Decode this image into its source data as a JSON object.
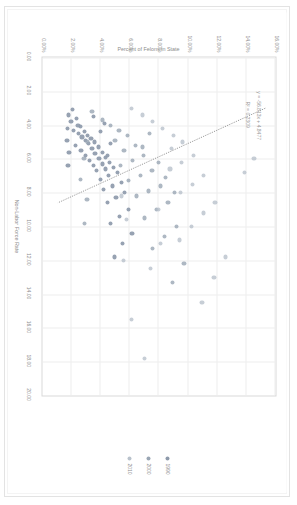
{
  "chart_data": {
    "type": "scatter",
    "title": "",
    "xlabel": "Non-Labor Force Rate",
    "ylabel": "Percent of Felons in State",
    "xlim": [
      0,
      20
    ],
    "ylim": [
      0,
      0.16
    ],
    "grid": true,
    "legend_position": "right",
    "x_ticks": [
      "0.00",
      "2.00",
      "4.00",
      "6.00",
      "8.00",
      "10.00",
      "12.00",
      "14.00",
      "16.00",
      "18.00",
      "20.00"
    ],
    "y_ticks": [
      "0.00%",
      "2.00%",
      "4.00%",
      "6.00%",
      "8.00%",
      "10.00%",
      "12.00%",
      "14.00%",
      "16.00%"
    ],
    "annotations": {
      "equation": "y = -56.813x + 4.8477",
      "r_squared": "R² = 0.2309"
    },
    "trendline": {
      "style": "dotted",
      "color": "#808080",
      "slope": -56.813,
      "intercept": 4.8477,
      "r2": 0.2309
    },
    "series": [
      {
        "name": "1990",
        "color": "#8e9aab",
        "points": [
          [
            3.1,
            0.0205
          ],
          [
            3.4,
            0.0178
          ],
          [
            3.6,
            0.0232
          ],
          [
            3.8,
            0.0196
          ],
          [
            4.0,
            0.0244
          ],
          [
            4.1,
            0.0262
          ],
          [
            4.3,
            0.0215
          ],
          [
            4.4,
            0.0288
          ],
          [
            4.5,
            0.025
          ],
          [
            4.6,
            0.031
          ],
          [
            4.7,
            0.0271
          ],
          [
            4.8,
            0.0333
          ],
          [
            4.9,
            0.0295
          ],
          [
            5.0,
            0.0358
          ],
          [
            5.1,
            0.0318
          ],
          [
            5.2,
            0.0225
          ],
          [
            5.3,
            0.0382
          ],
          [
            5.4,
            0.034
          ],
          [
            5.5,
            0.0264
          ],
          [
            5.6,
            0.041
          ],
          [
            5.7,
            0.0361
          ],
          [
            5.8,
            0.0298
          ],
          [
            5.9,
            0.0435
          ],
          [
            6.0,
            0.0388
          ],
          [
            6.1,
            0.0322
          ],
          [
            6.2,
            0.0462
          ],
          [
            6.3,
            0.041
          ],
          [
            6.4,
            0.0349
          ],
          [
            6.5,
            0.0488
          ],
          [
            6.6,
            0.0432
          ],
          [
            6.7,
            0.0372
          ],
          [
            6.8,
            0.0515
          ],
          [
            7.0,
            0.0455
          ],
          [
            7.2,
            0.0398
          ],
          [
            7.4,
            0.054
          ],
          [
            7.6,
            0.048
          ],
          [
            7.8,
            0.042
          ],
          [
            8.0,
            0.0565
          ],
          [
            8.3,
            0.0505
          ],
          [
            8.6,
            0.0445
          ],
          [
            9.0,
            0.059
          ],
          [
            9.4,
            0.0528
          ],
          [
            9.8,
            0.0468
          ],
          [
            10.4,
            0.0615
          ],
          [
            11.0,
            0.0552
          ],
          [
            11.8,
            0.0492
          ],
          [
            4.2,
            0.017
          ],
          [
            4.9,
            0.0168
          ],
          [
            5.6,
            0.0182
          ],
          [
            6.4,
            0.0175
          ],
          [
            3.5,
            0.035
          ],
          [
            3.9,
            0.0425
          ],
          [
            4.4,
            0.0398
          ],
          [
            5.1,
            0.0468
          ],
          [
            5.8,
            0.0448
          ]
        ]
      },
      {
        "name": "2000",
        "color": "#9aa6b4",
        "points": [
          [
            3.2,
            0.034
          ],
          [
            3.7,
            0.0412
          ],
          [
            4.0,
            0.0468
          ],
          [
            4.3,
            0.0525
          ],
          [
            4.6,
            0.0582
          ],
          [
            4.9,
            0.0498
          ],
          [
            5.2,
            0.064
          ],
          [
            5.5,
            0.056
          ],
          [
            5.8,
            0.0695
          ],
          [
            6.1,
            0.0618
          ],
          [
            6.4,
            0.0538
          ],
          [
            6.7,
            0.0752
          ],
          [
            7.0,
            0.0672
          ],
          [
            7.3,
            0.0592
          ],
          [
            7.6,
            0.0808
          ],
          [
            7.9,
            0.0728
          ],
          [
            8.2,
            0.0648
          ],
          [
            8.6,
            0.0862
          ],
          [
            9.0,
            0.0782
          ],
          [
            9.5,
            0.07
          ],
          [
            10.0,
            0.0918
          ],
          [
            10.6,
            0.0838
          ],
          [
            11.3,
            0.0755
          ],
          [
            12.2,
            0.0972
          ],
          [
            13.3,
            0.089
          ],
          [
            5.0,
            0.0308
          ],
          [
            6.0,
            0.0285
          ],
          [
            7.2,
            0.0262
          ],
          [
            8.4,
            0.0305
          ],
          [
            9.8,
            0.0288
          ],
          [
            4.5,
            0.0732
          ],
          [
            5.3,
            0.0688
          ],
          [
            6.2,
            0.0795
          ],
          [
            7.1,
            0.0845
          ],
          [
            8.0,
            0.0905
          ]
        ]
      },
      {
        "name": "2010",
        "color": "#b9c2cc",
        "points": [
          [
            3.0,
            0.0612
          ],
          [
            3.4,
            0.0688
          ],
          [
            3.8,
            0.0755
          ],
          [
            4.2,
            0.0822
          ],
          [
            4.6,
            0.0898
          ],
          [
            5.0,
            0.0962
          ],
          [
            5.4,
            0.0885
          ],
          [
            5.8,
            0.1035
          ],
          [
            6.2,
            0.0955
          ],
          [
            6.6,
            0.0875
          ],
          [
            7.0,
            0.1108
          ],
          [
            7.5,
            0.1028
          ],
          [
            8.0,
            0.0948
          ],
          [
            8.6,
            0.1185
          ],
          [
            9.2,
            0.1105
          ],
          [
            10.0,
            0.1022
          ],
          [
            10.8,
            0.0942
          ],
          [
            11.8,
            0.1258
          ],
          [
            13.0,
            0.1178
          ],
          [
            14.5,
            0.1095
          ],
          [
            6.0,
            0.1452
          ],
          [
            6.8,
            0.1385
          ],
          [
            9.0,
            0.0795
          ],
          [
            11.0,
            0.0812
          ],
          [
            12.5,
            0.0742
          ],
          [
            15.5,
            0.0612
          ],
          [
            17.8,
            0.0702
          ],
          [
            12.0,
            0.0558
          ],
          [
            9.6,
            0.0578
          ],
          [
            8.2,
            0.0545
          ]
        ]
      }
    ]
  }
}
